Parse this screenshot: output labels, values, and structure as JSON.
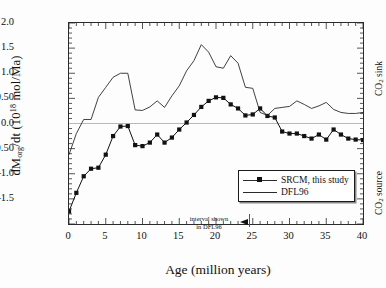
{
  "chart_data": {
    "type": "line",
    "title": "",
    "xlabel": "Age (million years)",
    "ylabel": "dM org /dt (10^18 mol/Ma)",
    "xlim": [
      0,
      40
    ],
    "ylim": [
      -2.0,
      2.0
    ],
    "grid": false,
    "zero_line": true,
    "legend_position": "bottom-right",
    "xticks": [
      0,
      5,
      10,
      15,
      20,
      25,
      30,
      35,
      40
    ],
    "xtick_labels": [
      "0",
      "5",
      "10",
      "15",
      "20",
      "25",
      "30",
      "35",
      "40"
    ],
    "yticks": [
      -1.5,
      -1.0,
      -0.5,
      0.0,
      0.5,
      1.0,
      1.5,
      2.0
    ],
    "ytick_labels": [
      "-1.5",
      "-1.0",
      "-0.50",
      "0.0",
      "0.50",
      "1.0",
      "1.5",
      "2.0"
    ],
    "annotations": [
      {
        "text_line1": "interval shown",
        "text_line2": "in DFL96",
        "marker": "left-arrow",
        "x": 25
      }
    ],
    "right_labels": [
      "CO2 sink",
      "CO2 source"
    ],
    "series": [
      {
        "name": "SRCM, this study",
        "marker": "square",
        "color": "#111111",
        "x": [
          0,
          1,
          2,
          3,
          4,
          5,
          6,
          7,
          8,
          9,
          10,
          11,
          12,
          13,
          14,
          15,
          16,
          17,
          18,
          19,
          20,
          21,
          22,
          23,
          24,
          25,
          26,
          27,
          28,
          29,
          30,
          31,
          32,
          33,
          34,
          35,
          36,
          37,
          38,
          39,
          40
        ],
        "y": [
          -1.75,
          -1.38,
          -1.05,
          -0.9,
          -0.88,
          -0.62,
          -0.25,
          -0.06,
          -0.05,
          -0.43,
          -0.45,
          -0.38,
          -0.22,
          -0.38,
          -0.28,
          -0.12,
          0.02,
          0.17,
          0.33,
          0.45,
          0.52,
          0.51,
          0.38,
          0.3,
          0.16,
          0.18,
          0.3,
          0.15,
          0.12,
          -0.16,
          -0.2,
          -0.2,
          -0.25,
          -0.3,
          -0.22,
          -0.32,
          -0.12,
          -0.22,
          -0.3,
          -0.32,
          -0.33
        ]
      },
      {
        "name": "DFL96",
        "marker": "none",
        "color": "#2b2b2b",
        "x": [
          0,
          1,
          2,
          3,
          4,
          5,
          6,
          7,
          8,
          9,
          10,
          11,
          12,
          13,
          14,
          15,
          16,
          17,
          18,
          19,
          20,
          21,
          22,
          23,
          24,
          25,
          26,
          27,
          28,
          29,
          30,
          31,
          32,
          33,
          34,
          35,
          36,
          37,
          38,
          39,
          40
        ],
        "y": [
          -0.62,
          -0.2,
          0.08,
          0.08,
          0.52,
          0.72,
          0.92,
          1.0,
          1.0,
          0.27,
          0.26,
          0.33,
          0.45,
          0.32,
          0.55,
          0.75,
          1.05,
          1.25,
          1.57,
          1.42,
          1.13,
          1.1,
          1.35,
          1.2,
          0.72,
          0.7,
          0.22,
          0.16,
          0.3,
          0.32,
          0.34,
          0.45,
          0.38,
          0.3,
          0.35,
          0.42,
          0.28,
          0.22,
          0.2,
          0.2,
          0.22
        ]
      }
    ]
  },
  "ylabel_parts": {
    "a": "dM",
    "sub": "org",
    "b": "/dt (10",
    "sup": "18",
    "c": " mol/Ma)"
  },
  "right_notes": {
    "sink_a": "CO",
    "sink_sub": "2",
    "sink_b": " sink",
    "source_a": "CO",
    "source_sub": "2",
    "source_b": " source"
  },
  "legend": {
    "items": [
      {
        "label": "SRCM, this study",
        "marker": "square"
      },
      {
        "label": "DFL96",
        "marker": "none"
      }
    ]
  }
}
